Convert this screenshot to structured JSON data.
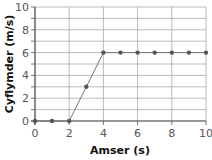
{
  "chart_data": {
    "type": "line",
    "title": "",
    "xlabel": "Amser (s)",
    "ylabel": "Cyflymder (m/s)",
    "xlim": [
      0,
      10
    ],
    "ylim": [
      0,
      10
    ],
    "x_ticks": [
      "0",
      "2",
      "4",
      "6",
      "8",
      "10"
    ],
    "y_ticks": [
      "0",
      "2",
      "4",
      "6",
      "8",
      "10"
    ],
    "grid": true,
    "legend": null,
    "series": [
      {
        "name": "velocity",
        "x": [
          0,
          1,
          2,
          3,
          4,
          5,
          6,
          7,
          8,
          9,
          10
        ],
        "values": [
          0,
          0,
          0,
          3,
          6,
          6,
          6,
          6,
          6,
          6,
          6
        ]
      }
    ],
    "colors": {
      "line": "#777777",
      "marker": "#555555",
      "grid": "#aaaaaa",
      "axis": "#555555"
    }
  }
}
